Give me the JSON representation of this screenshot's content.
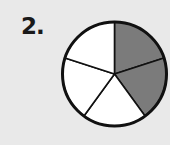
{
  "problem": {
    "number_label": "2.",
    "figure": {
      "type": "fraction-circle",
      "total_parts": 5,
      "shaded_parts": 2,
      "shaded_color": "#7b7b7b",
      "unshaded_color": "#ffffff",
      "outline_color": "#111111",
      "center": [
        114.5,
        74
      ],
      "radius": 52
    }
  }
}
